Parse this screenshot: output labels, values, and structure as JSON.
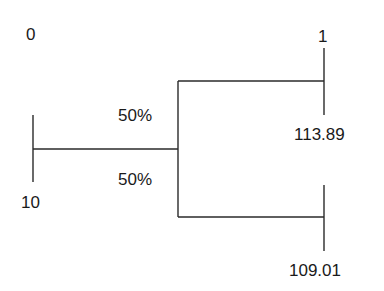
{
  "tree": {
    "root": {
      "top_label": "0",
      "bottom_label": "10"
    },
    "branches": [
      {
        "probability": "50%",
        "top_label": "1",
        "bottom_label": "113.89"
      },
      {
        "probability": "50%",
        "top_label": "",
        "bottom_label": "109.01"
      }
    ]
  },
  "colors": {
    "line": "#2a2a2a",
    "text": "#1a1a1a",
    "background": "#ffffff"
  }
}
